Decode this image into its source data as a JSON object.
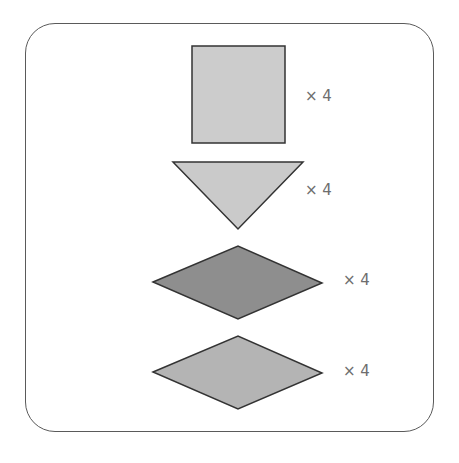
{
  "diagram": {
    "frame": {
      "stroke": "#5a5a5a",
      "radius": 30
    },
    "stroke_color": "#333333",
    "items": [
      {
        "shape": "square",
        "fill": "#cccccc",
        "points": "192,46 285,46 285,143 192,143",
        "label": "× 4",
        "label_pos": {
          "x": 305,
          "y": 89
        }
      },
      {
        "shape": "triangle-down",
        "fill": "#cacaca",
        "points": "173,162 303,162 238,229",
        "label": "× 4",
        "label_pos": {
          "x": 305,
          "y": 183
        }
      },
      {
        "shape": "rhombus",
        "fill": "#8e8e8e",
        "points": "153,282 238,246 322,283 238,319",
        "label": "× 4",
        "label_pos": {
          "x": 343,
          "y": 273
        }
      },
      {
        "shape": "rhombus",
        "fill": "#b4b4b4",
        "points": "153,372 238,336 322,373 238,409",
        "label": "× 4",
        "label_pos": {
          "x": 343,
          "y": 364
        }
      }
    ]
  }
}
